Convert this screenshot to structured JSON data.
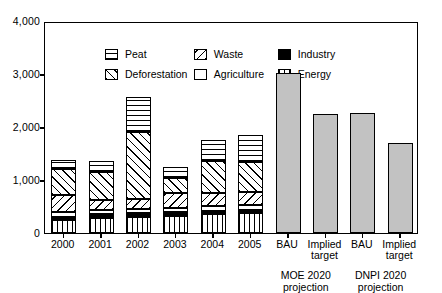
{
  "chart_data": {
    "type": "bar",
    "subtype": "stacked-bar-with-solid-projection-bars",
    "title": "",
    "xlabel": "",
    "ylabel": "",
    "ylim": [
      0,
      4000
    ],
    "y_ticks": [
      0,
      1000,
      2000,
      3000,
      4000
    ],
    "y_tick_labels": [
      "0",
      "1,000",
      "2,000",
      "3,000",
      "4,000"
    ],
    "grid": false,
    "legend_position": "upper-left-inside",
    "categories": [
      "2000",
      "2001",
      "2002",
      "2003",
      "2004",
      "2005",
      "BAU",
      "Implied target",
      "BAU",
      "Implied target"
    ],
    "series": [
      {
        "name": "Energy",
        "pattern": "vertical-lines",
        "values": [
          250,
          290,
          310,
          330,
          360,
          370,
          null,
          null,
          null,
          null
        ]
      },
      {
        "name": "Industry",
        "pattern": "solid-black",
        "values": [
          60,
          60,
          60,
          60,
          60,
          60,
          null,
          null,
          null,
          null
        ]
      },
      {
        "name": "Agriculture",
        "pattern": "white",
        "values": [
          90,
          90,
          90,
          90,
          90,
          90,
          null,
          null,
          null,
          null
        ]
      },
      {
        "name": "Waste",
        "pattern": "backslash-lines",
        "values": [
          310,
          180,
          180,
          270,
          240,
          250,
          null,
          null,
          null,
          null
        ]
      },
      {
        "name": "Deforestation",
        "pattern": "forwardslash-lines",
        "values": [
          500,
          530,
          1270,
          290,
          610,
          570,
          null,
          null,
          null,
          null
        ]
      },
      {
        "name": "Peat",
        "pattern": "horizontal-lines",
        "values": [
          170,
          200,
          650,
          200,
          400,
          510,
          null,
          null,
          null,
          null
        ]
      },
      {
        "name": "Projection",
        "pattern": "solid-gray",
        "values": [
          null,
          null,
          null,
          null,
          null,
          null,
          3010,
          2250,
          2270,
          1700
        ]
      }
    ],
    "totals": [
      1380,
      1350,
      2560,
      1240,
      1760,
      1850,
      3010,
      2250,
      2270,
      1700
    ],
    "group_labels": [
      "MOE 2020 projection",
      "DNPI 2020 projection"
    ],
    "colors": {
      "projection_fill": "#c2c2c2",
      "axis": "#000000",
      "background": "#ffffff"
    }
  },
  "legend": {
    "rows": [
      [
        {
          "label": "Peat",
          "pattern": "pat-peat"
        },
        {
          "label": "Waste",
          "pattern": "pat-waste"
        },
        {
          "label": "Industry",
          "pattern": "pat-industry"
        }
      ],
      [
        {
          "label": "Deforestation",
          "pattern": "pat-deforestation"
        },
        {
          "label": "Agriculture",
          "pattern": "pat-agriculture"
        },
        {
          "label": "Energy",
          "pattern": "pat-energy"
        }
      ]
    ]
  },
  "y_axis": {
    "labels": [
      "4,000",
      "3,000",
      "2,000",
      "1,000",
      "0"
    ]
  },
  "x_axis": {
    "categories": [
      {
        "label": "2000",
        "two_line": false
      },
      {
        "label": "2001",
        "two_line": false
      },
      {
        "label": "2002",
        "two_line": false
      },
      {
        "label": "2003",
        "two_line": false
      },
      {
        "label": "2004",
        "two_line": false
      },
      {
        "label": "2005",
        "two_line": false
      },
      {
        "label": "BAU",
        "two_line": false
      },
      {
        "label": "Implied target",
        "two_line": true
      },
      {
        "label": "BAU",
        "two_line": false
      },
      {
        "label": "Implied target",
        "two_line": true
      }
    ],
    "groups": [
      {
        "label": "MOE 2020 projection"
      },
      {
        "label": "DNPI 2020 projection"
      }
    ]
  }
}
